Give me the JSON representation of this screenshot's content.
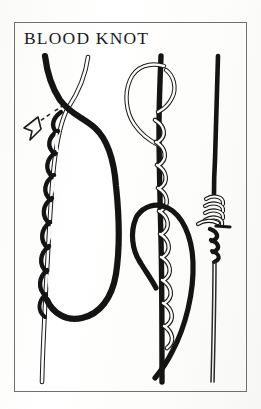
{
  "illustration": {
    "title": "BLOOD KNOT",
    "kind": "knot-tying-instruction-diagram",
    "panel_count": 3,
    "border_color": "#6f6f70",
    "ink_color": "#141414",
    "paper_color": "#fdfdfc"
  },
  "panels": [
    {
      "id": "panel-1",
      "name": "wrap-standing-line-step",
      "label": "",
      "annotation": {
        "name": "pull-direction-arrow",
        "style": "dashed-line-with-open-arrowhead",
        "direction": "down-left"
      }
    },
    {
      "id": "panel-2",
      "name": "pass-tag-end-through-loop-step",
      "label": ""
    },
    {
      "id": "panel-3",
      "name": "tightened-finished-knot-step",
      "label": ""
    }
  ]
}
